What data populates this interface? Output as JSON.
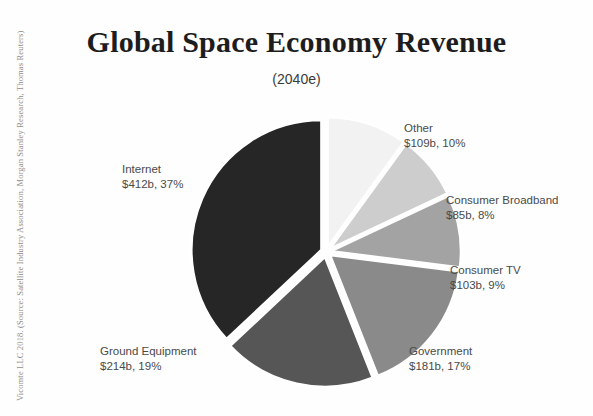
{
  "figure": {
    "title": "Global Space Economy Revenue",
    "subtitle": "(2040e)",
    "credit": "Vicomte LLC 2018. (Source: Satellite Industry Association, Morgan Stanley Research, Thomas Reuters)"
  },
  "chart_data": {
    "type": "pie",
    "title": "Global Space Economy Revenue",
    "subtitle": "(2040e)",
    "xlabel": "",
    "ylabel": "",
    "legend_position": "callout-labels",
    "grid": false,
    "exploded": true,
    "value_unit": "USD billions",
    "categories": [
      "Other",
      "Consumer Broadband",
      "Consumer TV",
      "Government",
      "Ground Equipment",
      "Internet"
    ],
    "values": [
      109,
      85,
      103,
      181,
      214,
      412
    ],
    "percentages": [
      10,
      8,
      9,
      17,
      19,
      37
    ],
    "colors": [
      "#f2f2f2",
      "#cdcdcd",
      "#a3a3a3",
      "#8a8a8a",
      "#565656",
      "#262626"
    ],
    "slices": [
      {
        "name": "Other",
        "value": 109,
        "percent": 10,
        "label_category": "Other",
        "label_value": "$109b, 10%",
        "color": "#f2f2f2"
      },
      {
        "name": "Consumer Broadband",
        "value": 85,
        "percent": 8,
        "label_category": "Consumer Broadband",
        "label_value": "$85b, 8%",
        "color": "#cdcdcd"
      },
      {
        "name": "Consumer TV",
        "value": 103,
        "percent": 9,
        "label_category": "Consumer TV",
        "label_value": "$103b, 9%",
        "color": "#a3a3a3"
      },
      {
        "name": "Government",
        "value": 181,
        "percent": 17,
        "label_category": "Government",
        "label_value": "$181b, 17%",
        "color": "#8a8a8a"
      },
      {
        "name": "Ground Equipment",
        "value": 214,
        "percent": 19,
        "label_category": "Ground Equipment",
        "label_value": "$214b, 19%",
        "color": "#565656"
      },
      {
        "name": "Internet",
        "value": 412,
        "percent": 37,
        "label_category": "Internet",
        "label_value": "$412b, 37%",
        "color": "#262626"
      }
    ]
  }
}
